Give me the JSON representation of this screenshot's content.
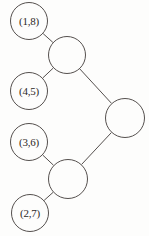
{
  "diagram": {
    "type": "tree",
    "background_color": "#fdfdfc",
    "stroke_color": "#55504e",
    "text_color": "#2b2826",
    "width": 149,
    "height": 236,
    "nodes": [
      {
        "id": "n1",
        "label": "(1,8)",
        "kind": "leaf",
        "cx": 29,
        "cy": 21,
        "r": 19
      },
      {
        "id": "n2",
        "label": "",
        "kind": "internal",
        "cx": 67,
        "cy": 55,
        "r": 19
      },
      {
        "id": "n3",
        "label": "(4,5)",
        "kind": "leaf",
        "cx": 29,
        "cy": 91,
        "r": 19
      },
      {
        "id": "n4",
        "label": "",
        "kind": "internal",
        "cx": 125,
        "cy": 118,
        "r": 20
      },
      {
        "id": "n5",
        "label": "(3,6)",
        "kind": "leaf",
        "cx": 29,
        "cy": 142,
        "r": 19
      },
      {
        "id": "n6",
        "label": "",
        "kind": "internal",
        "cx": 68,
        "cy": 179,
        "r": 20
      },
      {
        "id": "n7",
        "label": "(2,7)",
        "kind": "leaf",
        "cx": 30,
        "cy": 213,
        "r": 19
      }
    ],
    "edges": [
      {
        "from": "n1",
        "to": "n2"
      },
      {
        "from": "n3",
        "to": "n2"
      },
      {
        "from": "n2",
        "to": "n4"
      },
      {
        "from": "n5",
        "to": "n6"
      },
      {
        "from": "n7",
        "to": "n6"
      },
      {
        "from": "n6",
        "to": "n4"
      }
    ]
  }
}
